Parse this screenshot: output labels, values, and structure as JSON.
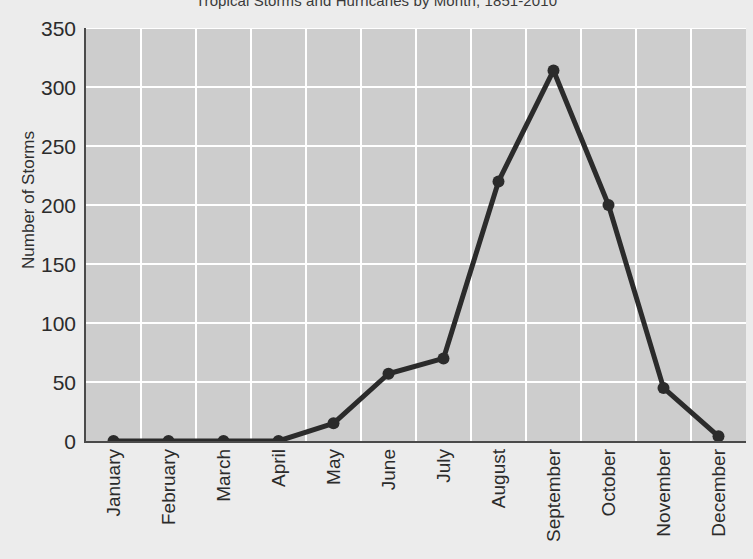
{
  "chart_data": {
    "type": "line",
    "title": "Tropical Storms and Hurricanes by Month, 1851-2010",
    "xlabel": "",
    "ylabel": "Number of Storms",
    "categories": [
      "January",
      "February",
      "March",
      "April",
      "May",
      "June",
      "July",
      "August",
      "September",
      "October",
      "November",
      "December"
    ],
    "values": [
      0,
      0,
      0,
      0,
      15,
      57,
      70,
      220,
      314,
      200,
      45,
      4
    ],
    "series": [
      {
        "name": "Number of Storms",
        "values": [
          0,
          0,
          0,
          0,
          15,
          57,
          70,
          220,
          314,
          200,
          45,
          4
        ]
      }
    ],
    "ylim": [
      0,
      350
    ],
    "y_ticks": [
      0,
      50,
      100,
      150,
      200,
      250,
      300,
      350
    ],
    "y_tick_labels": [
      "0",
      "50",
      "100",
      "150",
      "200",
      "250",
      "300",
      "350"
    ],
    "grid": true,
    "grid_color": "#ffffff",
    "legend": false,
    "legend_position": "none",
    "line_color": "#2b2b2b",
    "marker": "circle",
    "marker_color": "#2b2b2b",
    "plot_background": "#cdcdcd",
    "figure_background": "#ececec",
    "axis_color": "#4a4a4a"
  }
}
